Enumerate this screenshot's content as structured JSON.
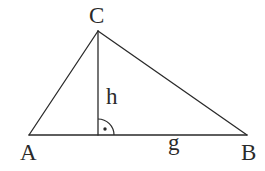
{
  "diagram": {
    "type": "triangle-with-altitude",
    "vertices": {
      "A": {
        "label": "A",
        "x": 29,
        "y": 135
      },
      "B": {
        "label": "B",
        "x": 247,
        "y": 135
      },
      "C": {
        "label": "C",
        "x": 98,
        "y": 31
      }
    },
    "altitude_foot": {
      "x": 98,
      "y": 135
    },
    "labels": {
      "vertex_a": "A",
      "vertex_b": "B",
      "vertex_c": "C",
      "height": "h",
      "base": "g"
    },
    "right_angle_marker": {
      "center": {
        "x": 98,
        "y": 135
      },
      "radius": 16,
      "dot": {
        "x": 105,
        "y": 129
      }
    },
    "colors": {
      "stroke": "#2a2a2a",
      "background": "#ffffff"
    }
  }
}
